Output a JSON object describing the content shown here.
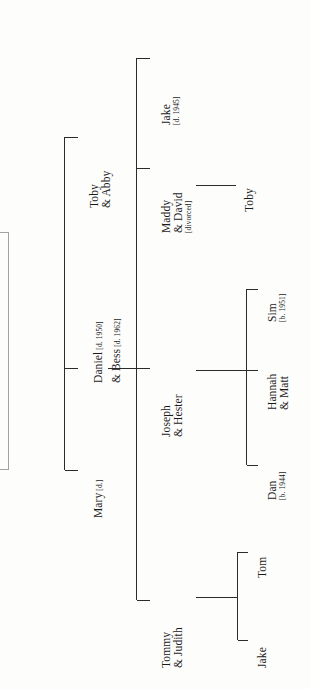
{
  "diagram": {
    "orientation": "rotated-90-left",
    "line_color": "#2b2b2b",
    "faint_line_color": "#9a9a9a",
    "text_color": "#1b1b1b",
    "background": "#fdfdfc"
  },
  "generations": {
    "g0": {
      "spouse_a": "Mary [d.]",
      "bracket_note": "partial bracket continues off the left edge"
    },
    "g1": {
      "couple_primary": {
        "name_line_1": "Daniel",
        "annotation_1": "[d. 1950]",
        "name_line_2": "& Bess",
        "annotation_2": "[d. 1962]"
      },
      "sibling": {
        "name_line_1": "Toby",
        "name_line_2": "& Abby"
      },
      "partner": {
        "name": "Mary",
        "annotation": "[d.]"
      }
    },
    "g2": [
      {
        "id": "jake-1945",
        "name_line_1": "Jake",
        "annotation": "[d. 1945]"
      },
      {
        "id": "maddy-david",
        "name_line_1": "Maddy",
        "name_line_2": "& David",
        "annotation": "[divorced]"
      },
      {
        "id": "joseph-hester",
        "name_line_1": "Joseph",
        "name_line_2": "& Hester"
      },
      {
        "id": "tommy-judith",
        "name_line_1": "Tommy",
        "name_line_2": "& Judith"
      }
    ],
    "g3": [
      {
        "id": "toby-child",
        "parent": "maddy-david",
        "name_line_1": "Toby"
      },
      {
        "id": "sim",
        "parent": "joseph-hester",
        "name_line_1": "Sim",
        "annotation": "[b. 1951]"
      },
      {
        "id": "hannah-matt",
        "parent": "joseph-hester",
        "name_line_1": "Hannah",
        "name_line_2": "& Matt"
      },
      {
        "id": "dan",
        "parent": "joseph-hester",
        "name_line_1": "Dan",
        "annotation": "[b. 1944]"
      },
      {
        "id": "tom",
        "parent": "tommy-judith",
        "name_line_1": "Tom"
      },
      {
        "id": "jake-child",
        "parent": "tommy-judith",
        "name_line_1": "Jake"
      }
    ]
  }
}
